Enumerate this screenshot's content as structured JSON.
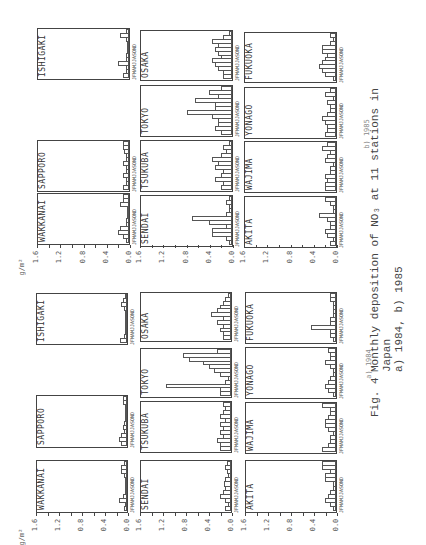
{
  "chart_data": [
    {
      "type": "bar",
      "title": "a) 1984",
      "ylabel": "g/m2",
      "ylim": [
        0,
        1.6
      ],
      "yticks": [
        "1.6",
        "1.2",
        "0.8",
        "0.4",
        "0.0"
      ],
      "categories": [
        "J",
        "F",
        "M",
        "A",
        "M",
        "J",
        "J",
        "A",
        "S",
        "O",
        "N",
        "D"
      ],
      "series": [
        {
          "name": "WAKKANAI",
          "values": [
            0.05,
            0.03,
            0.15,
            0.08,
            0.02,
            0.02,
            0.01,
            0.02,
            0.05,
            0.1,
            0.1,
            0.05
          ]
        },
        {
          "name": "SAPPORO",
          "values": [
            0.1,
            0.15,
            0.1,
            0.05,
            0.08,
            0.05,
            0.02,
            0.02,
            0.02,
            0.01,
            0.07,
            0.07
          ]
        },
        {
          "name": "ISHIGAKI",
          "values": [
            0.12,
            0.05,
            0.02,
            0.01,
            0.01,
            0.01,
            0.02,
            0.03,
            0.05,
            0.1,
            0.08,
            0.01
          ]
        },
        {
          "name": "SENDAI",
          "values": [
            0.1,
            0.05,
            0.1,
            0.2,
            0.15,
            0.1,
            0.12,
            0.1,
            0.05,
            0.08,
            0.1,
            0.08
          ]
        },
        {
          "name": "TSUKUBA",
          "values": [
            0.2,
            0.2,
            0.25,
            0.15,
            0.2,
            0.15,
            0.2,
            0.1,
            0.2,
            0.15,
            0.1,
            0.15
          ]
        },
        {
          "name": "TOKYO",
          "values": [
            0.2,
            0.2,
            1.15,
            0.1,
            0.05,
            0.2,
            0.3,
            0.4,
            0.5,
            0.75,
            0.85,
            0.25
          ]
        },
        {
          "name": "OSAKA",
          "values": [
            0.15,
            0.15,
            0.2,
            0.15,
            0.25,
            0.15,
            0.35,
            0.25,
            0.2,
            0.15,
            0.1,
            0.05
          ]
        },
        {
          "name": "AKITA",
          "values": [
            0.05,
            0.1,
            0.2,
            0.15,
            0.1,
            0.05,
            0.05,
            0.2,
            0.2,
            0.1,
            0.25,
            0.25
          ]
        },
        {
          "name": "WAJIMA",
          "values": [
            0.25,
            0.15,
            0.1,
            0.1,
            0.05,
            0.15,
            0.2,
            0.2,
            0.15,
            0.1,
            0.1,
            0.25
          ]
        },
        {
          "name": "YONAGO",
          "values": [
            0.05,
            0.15,
            0.2,
            0.15,
            0.1,
            0.05,
            0.05,
            0.1,
            0.2,
            0.1,
            0.1,
            0.15
          ]
        },
        {
          "name": "FUKUOKA",
          "values": [
            0.05,
            0.1,
            0.1,
            0.45,
            0.1,
            0.1,
            0.05,
            0.05,
            0.05,
            0.05,
            0.1,
            0.1
          ]
        }
      ]
    },
    {
      "type": "bar",
      "title": "b) 1985",
      "ylabel": "g/m2",
      "ylim": [
        0,
        1.6
      ],
      "yticks": [
        "1.6",
        "1.2",
        "0.8",
        "0.4",
        "0.0"
      ],
      "categories": [
        "J",
        "F",
        "M",
        "A",
        "M",
        "J",
        "J",
        "A",
        "S",
        "O",
        "N",
        "D"
      ],
      "series": [
        {
          "name": "WAKKANAI",
          "values": [
            0.05,
            0.1,
            0.2,
            0.15,
            0.05,
            0.05,
            0.02,
            0.02,
            0.02,
            0.15,
            0.1,
            0.1
          ]
        },
        {
          "name": "SAPPORO",
          "values": [
            0.1,
            0.05,
            0.05,
            0.1,
            0.05,
            0.05,
            0.1,
            0.05,
            0.05,
            0.08,
            0.1,
            0.1
          ]
        },
        {
          "name": "ISHIGAKI",
          "values": [
            0.1,
            0.05,
            0.05,
            0.2,
            0.05,
            0.05,
            0.02,
            0.02,
            0.02,
            0.05,
            0.15,
            0.05
          ]
        },
        {
          "name": "SENDAI",
          "values": [
            0.05,
            0.1,
            0.35,
            0.35,
            0.1,
            0.4,
            0.7,
            0.1,
            0.05,
            0.05,
            0.1,
            0.05
          ]
        },
        {
          "name": "TSUKUBA",
          "values": [
            0.2,
            0.15,
            0.3,
            0.2,
            0.15,
            0.3,
            0.25,
            0.35,
            0.2,
            0.1,
            0.15,
            0.05
          ]
        },
        {
          "name": "TOKYO",
          "values": [
            0.2,
            0.3,
            0.25,
            0.25,
            0.35,
            0.8,
            0.3,
            0.3,
            0.65,
            0.25,
            0.4,
            0.2
          ]
        },
        {
          "name": "OSAKA",
          "values": [
            0.15,
            0.15,
            0.25,
            0.3,
            0.35,
            0.2,
            0.25,
            0.3,
            0.25,
            0.35,
            0.15,
            0.05
          ]
        },
        {
          "name": "AKITA",
          "values": [
            0.1,
            0.05,
            0.15,
            0.2,
            0.1,
            0.1,
            0.15,
            0.3,
            0.05,
            0.05,
            0.1,
            0.2
          ]
        },
        {
          "name": "WAJIMA",
          "values": [
            0.2,
            0.2,
            0.15,
            0.2,
            0.1,
            0.1,
            0.05,
            0.2,
            0.15,
            0.1,
            0.25,
            0.15
          ]
        },
        {
          "name": "YONAGO",
          "values": [
            0.2,
            0.15,
            0.15,
            0.2,
            0.25,
            0.15,
            0.1,
            0.1,
            0.15,
            0.05,
            0.2,
            0.1
          ]
        },
        {
          "name": "FUKUOKA",
          "values": [
            0.05,
            0.2,
            0.25,
            0.3,
            0.25,
            0.2,
            0.15,
            0.25,
            0.25,
            0.1,
            0.05,
            0.1
          ]
        }
      ]
    }
  ],
  "figure": {
    "unit_label": "g/m²",
    "yticks": [
      "1.6",
      "1.2",
      "0.8",
      "0.4",
      "0.0"
    ],
    "month_axis_label": "JFMAMJJASOND",
    "panel_a_label": "a) 1984",
    "panel_b_label": "b) 1985",
    "caption": {
      "fig_number": "Fig. 4",
      "line1": "Monthly deposition of NO₃ at 11 stations in",
      "line2": "Japan",
      "line3": "a) 1984,  b) 1985"
    }
  },
  "layout": {
    "panels": [
      {
        "key": "a",
        "chart_index": 0,
        "label_pos": {
          "x": 354,
          "y": 360
        },
        "unit_pos": {
          "x": 14,
          "y": 533
        },
        "tick_rows": [
          {
            "x_left": 36,
            "x_right": 128,
            "y": 521
          },
          {
            "x_left": 140,
            "x_right": 232,
            "y": 521
          },
          {
            "x_left": 245,
            "x_right": 337,
            "y": 521
          }
        ],
        "frames": [
          {
            "series": 0,
            "x": 36,
            "y": 460,
            "w": 92,
            "h": 53
          },
          {
            "series": 1,
            "x": 36,
            "y": 395,
            "w": 92,
            "h": 53
          },
          {
            "series": 2,
            "x": 36,
            "y": 293,
            "w": 92,
            "h": 52
          },
          {
            "series": 3,
            "x": 140,
            "y": 460,
            "w": 92,
            "h": 53
          },
          {
            "series": 4,
            "x": 140,
            "y": 401,
            "w": 92,
            "h": 52
          },
          {
            "series": 5,
            "x": 140,
            "y": 348,
            "w": 92,
            "h": 50
          },
          {
            "series": 6,
            "x": 140,
            "y": 292,
            "w": 92,
            "h": 50
          },
          {
            "series": 7,
            "x": 245,
            "y": 460,
            "w": 92,
            "h": 53
          },
          {
            "series": 8,
            "x": 245,
            "y": 402,
            "w": 92,
            "h": 52
          },
          {
            "series": 9,
            "x": 245,
            "y": 347,
            "w": 92,
            "h": 52
          },
          {
            "series": 10,
            "x": 245,
            "y": 292,
            "w": 92,
            "h": 52
          }
        ]
      },
      {
        "key": "b",
        "chart_index": 1,
        "label_pos": {
          "x": 352,
          "y": 130
        },
        "unit_pos": {
          "x": 14,
          "y": 263
        },
        "tick_rows": [
          {
            "x_left": 37,
            "x_right": 130,
            "y": 253
          },
          {
            "x_left": 140,
            "x_right": 233,
            "y": 253
          },
          {
            "x_left": 244,
            "x_right": 337,
            "y": 253
          }
        ],
        "frames": [
          {
            "series": 0,
            "x": 37,
            "y": 193,
            "w": 93,
            "h": 52
          },
          {
            "series": 1,
            "x": 37,
            "y": 140,
            "w": 93,
            "h": 52
          },
          {
            "series": 2,
            "x": 37,
            "y": 28,
            "w": 93,
            "h": 52
          },
          {
            "series": 3,
            "x": 140,
            "y": 195,
            "w": 93,
            "h": 52
          },
          {
            "series": 4,
            "x": 140,
            "y": 140,
            "w": 93,
            "h": 52
          },
          {
            "series": 5,
            "x": 140,
            "y": 85,
            "w": 93,
            "h": 52
          },
          {
            "series": 6,
            "x": 140,
            "y": 30,
            "w": 93,
            "h": 51
          },
          {
            "series": 7,
            "x": 244,
            "y": 196,
            "w": 93,
            "h": 52
          },
          {
            "series": 8,
            "x": 244,
            "y": 141,
            "w": 93,
            "h": 52
          },
          {
            "series": 9,
            "x": 244,
            "y": 87,
            "w": 93,
            "h": 52
          },
          {
            "series": 10,
            "x": 244,
            "y": 32,
            "w": 93,
            "h": 51
          }
        ]
      }
    ]
  }
}
